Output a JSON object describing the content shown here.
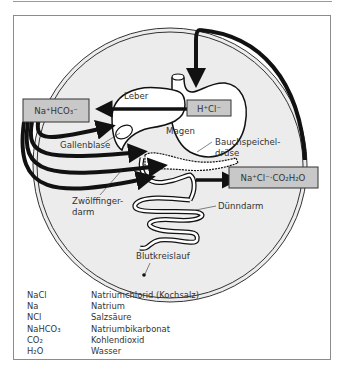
{
  "diagram": {
    "boxes": {
      "sodium_bicarbonate": "Na⁺HCO₃⁻",
      "hydrochloric_acid": "H⁺Cl⁻",
      "products": "Na⁺Cl⁻·CO₂H₂O"
    },
    "labels": {
      "liver": "Leber",
      "stomach": "Magen",
      "gallbladder": "Gallenblase",
      "pancreas_line1": "Bauchspeichel-",
      "pancreas_line2": "drüse",
      "duodenum_line1": "Zwölffinger-",
      "duodenum_line2": "darm",
      "small_intestine": "Dünndarm",
      "circulation": "Blutkreislauf"
    },
    "colors": {
      "box_fill": "#c8c8c8",
      "body_fill": "#ececec",
      "arrow": "#111111"
    }
  },
  "legend": [
    {
      "key": "NaCl",
      "value": "Natriumchlorid (Kochsalz)"
    },
    {
      "key": "Na",
      "value": "Natrium"
    },
    {
      "key": "NCl",
      "value": "Salzsäure"
    },
    {
      "key": "NaHCO₃",
      "value": "Natriumbikarbonat"
    },
    {
      "key": "CO₂",
      "value": "Kohlendioxid"
    },
    {
      "key": "H₂O",
      "value": "Wasser"
    }
  ]
}
